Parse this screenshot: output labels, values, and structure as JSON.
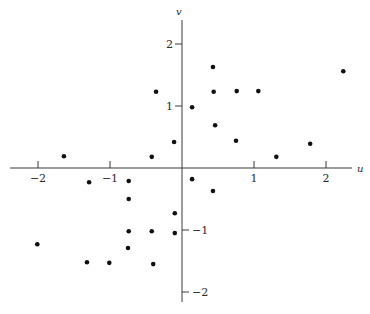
{
  "chart_data": {
    "type": "scatter",
    "title": "",
    "xlabel": "u",
    "ylabel": "v",
    "xlim": [
      -2.3,
      2.5
    ],
    "ylim": [
      -2.2,
      2.4
    ],
    "grid": false,
    "legend": null,
    "x_ticks": [
      -2,
      -1,
      1,
      2
    ],
    "x_tick_labels": [
      "−2",
      "−1",
      "1",
      "2"
    ],
    "y_ticks": [
      2,
      1,
      -1,
      -2
    ],
    "y_tick_labels": [
      "2",
      "1",
      "−1",
      "−2"
    ],
    "points": [
      {
        "u": 0.43,
        "v": 1.63
      },
      {
        "u": 0.44,
        "v": 1.23
      },
      {
        "u": 0.76,
        "v": 1.24
      },
      {
        "u": 1.06,
        "v": 1.24
      },
      {
        "u": 0.14,
        "v": 0.98
      },
      {
        "u": 0.46,
        "v": 0.69
      },
      {
        "u": 0.75,
        "v": 0.44
      },
      {
        "u": 2.24,
        "v": 1.56
      },
      {
        "u": 1.78,
        "v": 0.39
      },
      {
        "u": 1.31,
        "v": 0.18
      },
      {
        "u": -0.36,
        "v": 1.23
      },
      {
        "u": -0.11,
        "v": 0.42
      },
      {
        "u": -0.42,
        "v": 0.18
      },
      {
        "u": -1.64,
        "v": 0.19
      },
      {
        "u": 0.14,
        "v": -0.18
      },
      {
        "u": 0.43,
        "v": -0.37
      },
      {
        "u": -1.29,
        "v": -0.23
      },
      {
        "u": -0.74,
        "v": -0.21
      },
      {
        "u": -0.74,
        "v": -0.5
      },
      {
        "u": -0.1,
        "v": -0.73
      },
      {
        "u": -0.74,
        "v": -1.02
      },
      {
        "u": -0.42,
        "v": -1.02
      },
      {
        "u": -0.1,
        "v": -1.05
      },
      {
        "u": -0.75,
        "v": -1.29
      },
      {
        "u": -1.01,
        "v": -1.53
      },
      {
        "u": -0.4,
        "v": -1.55
      },
      {
        "u": -2.01,
        "v": -1.23
      },
      {
        "u": -1.32,
        "v": -1.52
      }
    ]
  },
  "layout": {
    "origin_px": [
      182,
      168
    ],
    "px_per_unit_x": 72,
    "px_per_unit_y": 62,
    "x_axis_px": [
      10,
      352
    ],
    "y_axis_px": [
      20,
      302
    ],
    "point_radius": 2.3,
    "point_color": "#111111",
    "axis_color": "#3a3a3a"
  }
}
